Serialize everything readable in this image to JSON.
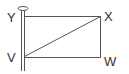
{
  "diagram": {
    "labels": {
      "top_left": "Y",
      "top_right": "X",
      "bottom_right": "W",
      "bottom_left": "V"
    },
    "colors": {
      "stroke": "#555555",
      "text": "#333333",
      "background": "#ffffff"
    }
  }
}
